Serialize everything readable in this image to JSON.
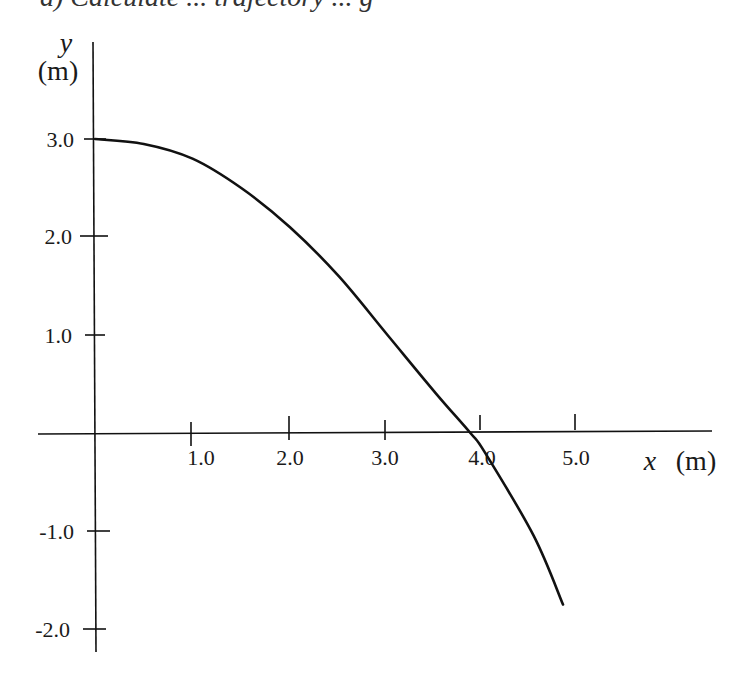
{
  "header": {
    "text": "a) Calculate ... trajectory ... g"
  },
  "chart_data": {
    "type": "line",
    "title": "",
    "xlabel": "x (m)",
    "ylabel": "y (m)",
    "xlabel_var": "x",
    "xlabel_unit": "(m)",
    "ylabel_var": "y",
    "ylabel_unit": "(m)",
    "xlim": [
      0,
      6.3
    ],
    "ylim": [
      -2.1,
      4.0
    ],
    "x_ticks": [
      "1.0",
      "2.0",
      "3.0",
      "4.0",
      "5.0"
    ],
    "y_ticks": [
      "3.0",
      "2.0",
      "1.0",
      "-1.0",
      "-2.0"
    ],
    "grid": false,
    "legend": null,
    "series": [
      {
        "name": "trajectory",
        "x": [
          0.0,
          0.5,
          1.0,
          1.5,
          2.0,
          2.5,
          3.0,
          3.5,
          3.85,
          4.0,
          4.5,
          4.8
        ],
        "y": [
          3.0,
          2.95,
          2.8,
          2.5,
          2.1,
          1.6,
          1.0,
          0.4,
          0.0,
          -0.2,
          -1.05,
          -1.75
        ]
      }
    ],
    "color": "#111111"
  }
}
